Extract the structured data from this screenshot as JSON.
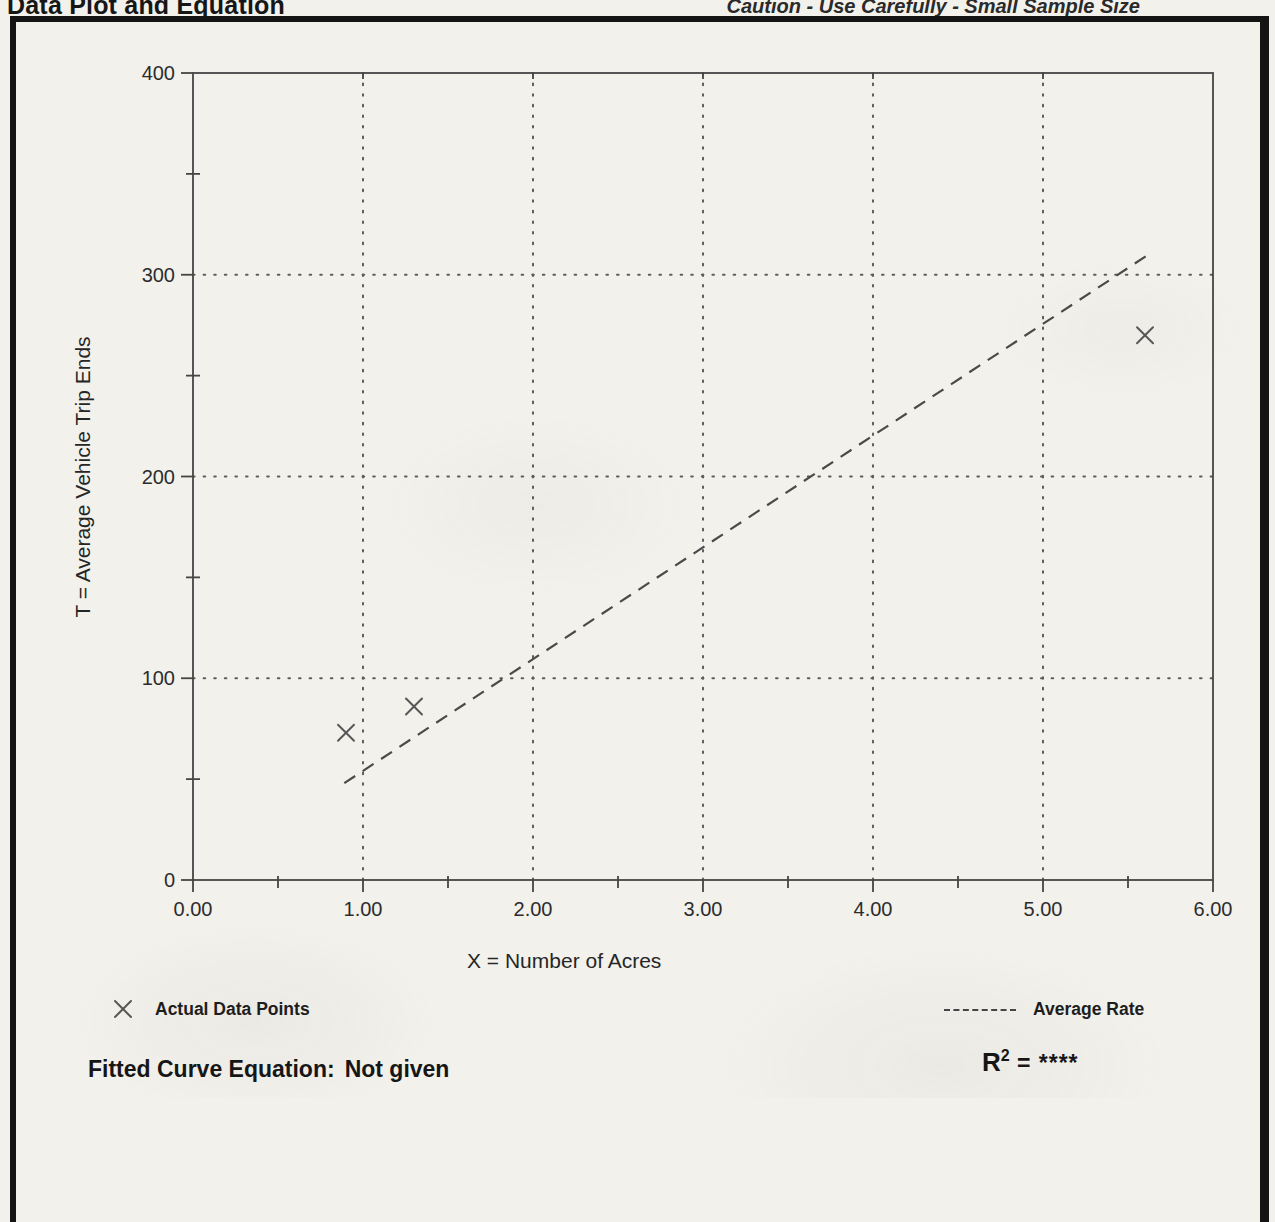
{
  "page": {
    "title": "Data Plot and Equation",
    "caution": "Caution - Use Carefully - Small Sample Size"
  },
  "chart_data": {
    "type": "scatter",
    "xlabel": "X = Number of Acres",
    "ylabel": "T = Average Vehicle Trip Ends",
    "xlim": [
      0,
      6
    ],
    "ylim": [
      0,
      400
    ],
    "x_ticks": [
      "0.00",
      "1.00",
      "2.00",
      "3.00",
      "4.00",
      "5.00",
      "6.00"
    ],
    "y_ticks": [
      "0",
      "100",
      "200",
      "300",
      "400"
    ],
    "x_minor_ticks": [
      0.5,
      1.5,
      2.5,
      3.5,
      4.5,
      5.5
    ],
    "y_minor_ticks": [
      50,
      150,
      250,
      350
    ],
    "x_grid": [
      1,
      2,
      3,
      4,
      5
    ],
    "y_grid": [
      100,
      200,
      300
    ],
    "grid_style": "dotted",
    "legend_position": "below-left and below-right",
    "series": [
      {
        "name": "Actual Data Points",
        "type": "scatter",
        "marker": "x",
        "points": [
          {
            "x": 0.9,
            "t": 73
          },
          {
            "x": 1.3,
            "t": 86
          },
          {
            "x": 5.6,
            "t": 270
          }
        ]
      },
      {
        "name": "Average Rate",
        "type": "line",
        "style": "dashed",
        "from": {
          "x": 0.89,
          "t": 48
        },
        "to": {
          "x": 5.62,
          "t": 310
        }
      }
    ]
  },
  "footer": {
    "fitted_label": "Fitted Curve Equation:",
    "fitted_value": "Not given",
    "r2_base": "R",
    "r2_exp": "2",
    "r2_rest": "= ****"
  }
}
